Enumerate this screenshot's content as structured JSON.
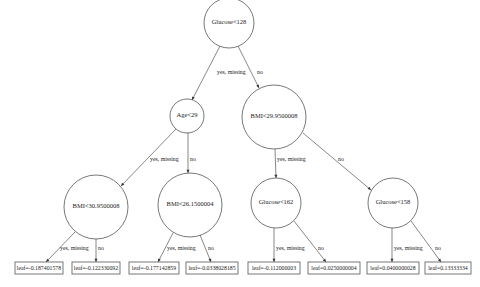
{
  "tree": {
    "nodes": [
      {
        "id": "n0",
        "label": "Glucose<128",
        "cx": 229,
        "cy": 23,
        "r": 25
      },
      {
        "id": "n1",
        "label": "Age<29",
        "cx": 187,
        "cy": 116,
        "r": 17
      },
      {
        "id": "n2",
        "label": "BMI<29.9500008",
        "cx": 274,
        "cy": 117,
        "r": 32
      },
      {
        "id": "n3",
        "label": "BMI<30.9500008",
        "cx": 96,
        "cy": 207,
        "r": 32
      },
      {
        "id": "n4",
        "label": "BMI<26.1500004",
        "cx": 190,
        "cy": 205,
        "r": 32
      },
      {
        "id": "n5",
        "label": "Glucose<162",
        "cx": 276,
        "cy": 203,
        "r": 25
      },
      {
        "id": "n6",
        "label": "Glucose<158",
        "cx": 393,
        "cy": 203,
        "r": 25
      }
    ],
    "leaves": [
      {
        "id": "l0",
        "label": "leaf=-0.187401578",
        "x": 15,
        "y": 262,
        "w": 48,
        "h": 12
      },
      {
        "id": "l1",
        "label": "leaf=-0.122330092",
        "x": 72,
        "y": 262,
        "w": 48,
        "h": 12
      },
      {
        "id": "l2",
        "label": "leaf=-0.177142859",
        "x": 129,
        "y": 262,
        "w": 50,
        "h": 12
      },
      {
        "id": "l3",
        "label": "leaf=-0.0338028185",
        "x": 186,
        "y": 262,
        "w": 52,
        "h": 12
      },
      {
        "id": "l4",
        "label": "leaf=-0.112000003",
        "x": 248,
        "y": 262,
        "w": 52,
        "h": 12
      },
      {
        "id": "l5",
        "label": "leaf=0.0250000004",
        "x": 308,
        "y": 262,
        "w": 52,
        "h": 12
      },
      {
        "id": "l6",
        "label": "leaf=0.0400000028",
        "x": 367,
        "y": 262,
        "w": 52,
        "h": 12
      },
      {
        "id": "l7",
        "label": "leaf=0.13333334",
        "x": 425,
        "y": 262,
        "w": 46,
        "h": 12
      }
    ],
    "edges": [
      {
        "from": "n0",
        "to": "n1",
        "label": "yes, missing",
        "x1": 220,
        "y1": 46,
        "x2": 192,
        "y2": 100,
        "lx": 217,
        "ly": 74
      },
      {
        "from": "n0",
        "to": "n2",
        "label": "no",
        "x1": 238,
        "y1": 46,
        "x2": 259,
        "y2": 88,
        "lx": 257,
        "ly": 74
      },
      {
        "from": "n1",
        "to": "n3",
        "label": "yes, missing",
        "x1": 176,
        "y1": 129,
        "x2": 121,
        "y2": 186,
        "lx": 150,
        "ly": 161
      },
      {
        "from": "n1",
        "to": "n4",
        "label": "no",
        "x1": 188,
        "y1": 133,
        "x2": 188,
        "y2": 173,
        "lx": 190,
        "ly": 161
      },
      {
        "from": "n2",
        "to": "n5",
        "label": "yes, missing",
        "x1": 275,
        "y1": 149,
        "x2": 276,
        "y2": 178,
        "lx": 277,
        "ly": 161
      },
      {
        "from": "n2",
        "to": "n6",
        "label": "no",
        "x1": 303,
        "y1": 133,
        "x2": 371,
        "y2": 190,
        "lx": 338,
        "ly": 161
      },
      {
        "from": "n3",
        "to": "l0",
        "label": "yes, missing",
        "x1": 75,
        "y1": 232,
        "x2": 46,
        "y2": 262,
        "lx": 60,
        "ly": 250
      },
      {
        "from": "n3",
        "to": "l1",
        "label": "no",
        "x1": 96,
        "y1": 239,
        "x2": 96,
        "y2": 262,
        "lx": 98,
        "ly": 250
      },
      {
        "from": "n4",
        "to": "l2",
        "label": "yes, missing",
        "x1": 173,
        "y1": 233,
        "x2": 158,
        "y2": 262,
        "lx": 167,
        "ly": 250
      },
      {
        "from": "n4",
        "to": "l3",
        "label": "no",
        "x1": 200,
        "y1": 235,
        "x2": 211,
        "y2": 262,
        "lx": 208,
        "ly": 250
      },
      {
        "from": "n5",
        "to": "l4",
        "label": "yes, missing",
        "x1": 274,
        "y1": 228,
        "x2": 274,
        "y2": 262,
        "lx": 276,
        "ly": 250
      },
      {
        "from": "n5",
        "to": "l5",
        "label": "no",
        "x1": 294,
        "y1": 221,
        "x2": 326,
        "y2": 262,
        "lx": 318,
        "ly": 250
      },
      {
        "from": "n6",
        "to": "l6",
        "label": "yes, missing",
        "x1": 392,
        "y1": 228,
        "x2": 392,
        "y2": 262,
        "lx": 394,
        "ly": 250
      },
      {
        "from": "n6",
        "to": "l7",
        "label": "no",
        "x1": 411,
        "y1": 221,
        "x2": 441,
        "y2": 262,
        "lx": 435,
        "ly": 250
      }
    ]
  }
}
